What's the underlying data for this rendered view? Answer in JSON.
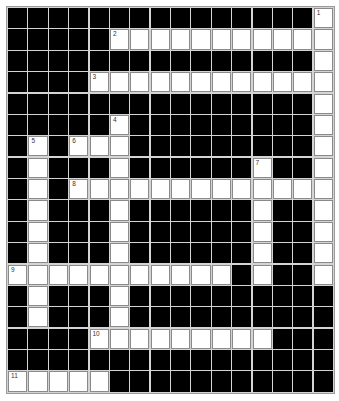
{
  "puzzle": {
    "cols": 16,
    "rows": 18,
    "colors": {
      "block": "#000000",
      "open": "#ffffff",
      "gridline": "#d4d4d4",
      "cell_border": "#8a8a8a"
    },
    "open_cells": [
      [
        0,
        15
      ],
      [
        1,
        5
      ],
      [
        1,
        6
      ],
      [
        1,
        7
      ],
      [
        1,
        8
      ],
      [
        1,
        9
      ],
      [
        1,
        10
      ],
      [
        1,
        11
      ],
      [
        1,
        12
      ],
      [
        1,
        13
      ],
      [
        1,
        14
      ],
      [
        1,
        15
      ],
      [
        2,
        15
      ],
      [
        3,
        4
      ],
      [
        3,
        5
      ],
      [
        3,
        6
      ],
      [
        3,
        7
      ],
      [
        3,
        8
      ],
      [
        3,
        9
      ],
      [
        3,
        10
      ],
      [
        3,
        11
      ],
      [
        3,
        12
      ],
      [
        3,
        13
      ],
      [
        3,
        14
      ],
      [
        3,
        15
      ],
      [
        4,
        15
      ],
      [
        5,
        5
      ],
      [
        5,
        15
      ],
      [
        6,
        1
      ],
      [
        6,
        3
      ],
      [
        6,
        4
      ],
      [
        6,
        5
      ],
      [
        6,
        15
      ],
      [
        7,
        1
      ],
      [
        7,
        5
      ],
      [
        7,
        12
      ],
      [
        7,
        15
      ],
      [
        8,
        1
      ],
      [
        8,
        3
      ],
      [
        8,
        4
      ],
      [
        8,
        5
      ],
      [
        8,
        6
      ],
      [
        8,
        7
      ],
      [
        8,
        8
      ],
      [
        8,
        9
      ],
      [
        8,
        10
      ],
      [
        8,
        11
      ],
      [
        8,
        12
      ],
      [
        8,
        13
      ],
      [
        8,
        14
      ],
      [
        8,
        15
      ],
      [
        9,
        1
      ],
      [
        9,
        5
      ],
      [
        9,
        12
      ],
      [
        9,
        15
      ],
      [
        10,
        1
      ],
      [
        10,
        5
      ],
      [
        10,
        12
      ],
      [
        10,
        15
      ],
      [
        11,
        1
      ],
      [
        11,
        5
      ],
      [
        11,
        12
      ],
      [
        11,
        15
      ],
      [
        12,
        0
      ],
      [
        12,
        1
      ],
      [
        12,
        2
      ],
      [
        12,
        3
      ],
      [
        12,
        4
      ],
      [
        12,
        5
      ],
      [
        12,
        6
      ],
      [
        12,
        7
      ],
      [
        12,
        8
      ],
      [
        12,
        9
      ],
      [
        12,
        10
      ],
      [
        12,
        12
      ],
      [
        12,
        15
      ],
      [
        13,
        1
      ],
      [
        13,
        5
      ],
      [
        14,
        1
      ],
      [
        14,
        5
      ],
      [
        15,
        4
      ],
      [
        15,
        5
      ],
      [
        15,
        6
      ],
      [
        15,
        7
      ],
      [
        15,
        8
      ],
      [
        15,
        9
      ],
      [
        15,
        10
      ],
      [
        15,
        11
      ],
      [
        15,
        12
      ],
      [
        17,
        0
      ],
      [
        17,
        1
      ],
      [
        17,
        2
      ],
      [
        17,
        3
      ],
      [
        17,
        4
      ]
    ],
    "numbers": [
      {
        "label": "1",
        "row": 0,
        "col": 15
      },
      {
        "label": "2",
        "row": 1,
        "col": 5
      },
      {
        "label": "3",
        "row": 3,
        "col": 4
      },
      {
        "label": "4",
        "row": 5,
        "col": 5
      },
      {
        "label": "5",
        "row": 6,
        "col": 1
      },
      {
        "label": "6",
        "row": 6,
        "col": 3
      },
      {
        "label": "7",
        "row": 7,
        "col": 12
      },
      {
        "label": "8",
        "row": 8,
        "col": 3
      },
      {
        "label": "9",
        "row": 12,
        "col": 0
      },
      {
        "label": "10",
        "row": 15,
        "col": 4
      },
      {
        "label": "11",
        "row": 17,
        "col": 0
      }
    ],
    "entries": []
  }
}
